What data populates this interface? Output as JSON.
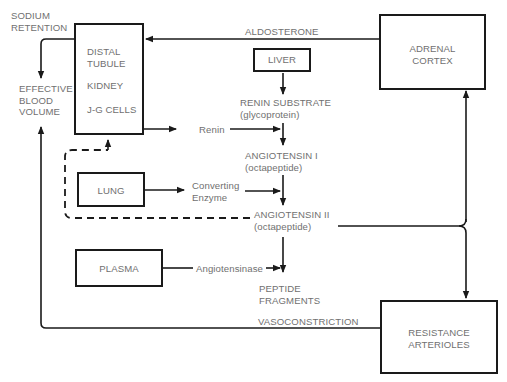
{
  "diagram": {
    "colors": {
      "line": "#1a1a1a",
      "text": "#707070",
      "background": "#ffffff"
    },
    "labels": {
      "sodium_retention": [
        "SODIUM",
        "RETENTION"
      ],
      "effective_blood_volume": [
        "EFFECTIVE",
        "BLOOD",
        "VOLUME"
      ],
      "aldosterone": "ALDOSTERONE",
      "renin": "Renin",
      "renin_substrate": [
        "RENIN SUBSTRATE",
        "(glycoprotein)"
      ],
      "angiotensin_i": [
        "ANGIOTENSIN I",
        "(octapeptide)"
      ],
      "converting_enzyme": [
        "Converting",
        "Enzyme"
      ],
      "angiotensin_ii": [
        "ANGIOTENSIN II",
        "(octapeptide)"
      ],
      "angiotensinase": "Angiotensinase",
      "peptide_fragments": [
        "PEPTIDE",
        "FRAGMENTS"
      ],
      "vasoconstriction": "VASOCONSTRICTION"
    },
    "boxes": {
      "kidney": {
        "lines": [
          "DISTAL",
          "TUBULE",
          "KIDNEY",
          "J-G CELLS"
        ]
      },
      "liver": {
        "lines": [
          "LIVER"
        ]
      },
      "adrenal_cortex": {
        "lines": [
          "ADRENAL",
          "CORTEX"
        ]
      },
      "lung": {
        "lines": [
          "LUNG"
        ]
      },
      "plasma": {
        "lines": [
          "PLASMA"
        ]
      },
      "resistance_arterioles": {
        "lines": [
          "RESISTANCE",
          "ARTERIOLES"
        ]
      }
    },
    "edges": [
      {
        "from": "adrenal_cortex",
        "to": "kidney",
        "label": "ALDOSTERONE",
        "style": "solid"
      },
      {
        "from": "kidney",
        "to": "effective_blood_volume",
        "label": "SODIUM RETENTION",
        "style": "solid"
      },
      {
        "from": "kidney",
        "to": "angiotensin_i",
        "label": "Renin",
        "style": "solid"
      },
      {
        "from": "liver",
        "to": "renin_substrate",
        "style": "solid"
      },
      {
        "from": "renin_substrate",
        "to": "angiotensin_i",
        "style": "solid"
      },
      {
        "from": "lung",
        "to": "angiotensin_ii",
        "label": "Converting Enzyme",
        "style": "solid"
      },
      {
        "from": "angiotensin_i",
        "to": "angiotensin_ii",
        "style": "solid"
      },
      {
        "from": "angiotensin_ii",
        "to": "kidney",
        "style": "dashed"
      },
      {
        "from": "angiotensin_ii",
        "to": "adrenal_cortex",
        "style": "solid"
      },
      {
        "from": "angiotensin_ii",
        "to": "resistance_arterioles",
        "style": "solid"
      },
      {
        "from": "plasma",
        "to": "peptide_fragments",
        "label": "Angiotensinase",
        "style": "solid"
      },
      {
        "from": "angiotensin_ii",
        "to": "peptide_fragments",
        "style": "solid"
      },
      {
        "from": "resistance_arterioles",
        "to": "effective_blood_volume",
        "label": "VASOCONSTRICTION",
        "style": "solid"
      }
    ]
  }
}
